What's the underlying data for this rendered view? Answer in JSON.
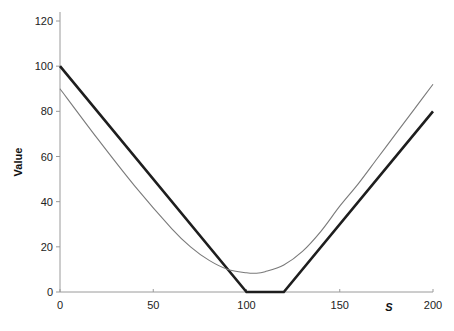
{
  "chart_data": {
    "type": "line",
    "title": "",
    "xlabel": "S",
    "ylabel": "Value",
    "xlim": [
      0,
      200
    ],
    "ylim": [
      0,
      120
    ],
    "x_ticks": [
      0,
      50,
      100,
      150,
      200
    ],
    "y_ticks": [
      0,
      20,
      40,
      60,
      80,
      100,
      120
    ],
    "grid": false,
    "legend": null,
    "series": [
      {
        "name": "payoff (thick)",
        "style": "thick",
        "color": "#1e1e1e",
        "x": [
          0,
          100,
          120,
          200
        ],
        "y": [
          100,
          0,
          0,
          80
        ]
      },
      {
        "name": "value (thin)",
        "style": "thin",
        "color": "#7a7a7a",
        "x": [
          0,
          20,
          40,
          60,
          70,
          80,
          90,
          100,
          105,
          110,
          120,
          130,
          140,
          150,
          160,
          170,
          180,
          190,
          200
        ],
        "y": [
          90,
          68,
          47,
          28,
          20,
          14,
          10,
          8.5,
          8.3,
          9,
          12,
          18,
          27,
          38,
          48,
          59,
          70,
          81,
          92
        ]
      }
    ]
  },
  "labels": {
    "y_axis_title": "Value",
    "x_axis_title": "S",
    "x_ticks": [
      "0",
      "50",
      "100",
      "150",
      "200"
    ],
    "y_ticks": [
      "0",
      "20",
      "40",
      "60",
      "80",
      "100",
      "120"
    ]
  }
}
